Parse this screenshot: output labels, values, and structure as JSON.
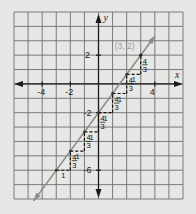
{
  "chart_data": {
    "type": "line",
    "title": "",
    "xlabel": "x",
    "ylabel": "y",
    "xlim": [
      -6,
      6
    ],
    "ylim": [
      -8,
      5
    ],
    "grid": true,
    "x_ticks": [
      {
        "value": -4,
        "label": "-4"
      },
      {
        "value": -2,
        "label": "-2"
      },
      {
        "value": 4,
        "label": "4"
      }
    ],
    "y_ticks": [
      {
        "value": 2,
        "label": "2"
      },
      {
        "value": -2,
        "label": "-2"
      },
      {
        "value": -6,
        "label": "-6"
      }
    ],
    "series": [
      {
        "name": "line",
        "slope": "4/3",
        "x": [
          -4.6,
          4.0
        ],
        "y": [
          -8.13,
          3.33
        ],
        "color": "#8c8c8c"
      }
    ],
    "highlight_point": {
      "x": 3,
      "y": 2,
      "label": "(3, 2)"
    },
    "steps": [
      {
        "from": [
          -3,
          -6
        ],
        "run": 1,
        "rise": "4/3",
        "run_label": "1",
        "rise_num": "4",
        "rise_den": "3"
      },
      {
        "from": [
          -2,
          -4.6667
        ],
        "run": 1,
        "rise": "4/3",
        "run_label": "1",
        "rise_num": "4",
        "rise_den": "3"
      },
      {
        "from": [
          -1,
          -3.3333
        ],
        "run": 1,
        "rise": "4/3",
        "run_label": "1",
        "rise_num": "4",
        "rise_den": "3"
      },
      {
        "from": [
          0,
          -2
        ],
        "run": 1,
        "rise": "4/3",
        "run_label": "1",
        "rise_num": "4",
        "rise_den": "3"
      },
      {
        "from": [
          1,
          -0.6667
        ],
        "run": 1,
        "rise": "4/3",
        "run_label": "1",
        "rise_num": "4",
        "rise_den": "3"
      },
      {
        "from": [
          2,
          0.6667
        ],
        "run": 1,
        "rise": "4/3",
        "run_label": "1",
        "rise_num": "4",
        "rise_den": "3"
      }
    ],
    "colors": {
      "background": "#e7e7e5",
      "grid": "#6e6e6e",
      "axis": "#1a1a1a",
      "line": "#8c8c8c",
      "point_label": "#9a9a9a"
    }
  }
}
